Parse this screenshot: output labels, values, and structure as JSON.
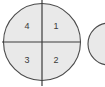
{
  "canvas": {
    "width": 105,
    "height": 87,
    "background_color": "#ffffff"
  },
  "style": {
    "circle_fill": "#e9e9e9",
    "circle_stroke": "#4a4a4a",
    "circle_stroke_width": 1.1,
    "axis_stroke": "#3c3c3c",
    "axis_stroke_width": 1.2,
    "label_color": "#3a3a3a",
    "label_font_size": 9
  },
  "main_circle": {
    "name": "quadrant-circle",
    "center_x": 42,
    "center_y": 42,
    "radius": 38.5,
    "quadrants": [
      {
        "id": "q-upper-right",
        "label": "1",
        "position": "upper-right",
        "label_x": 56,
        "label_y": 26
      },
      {
        "id": "q-lower-right",
        "label": "2",
        "position": "lower-right",
        "label_x": 56,
        "label_y": 60
      },
      {
        "id": "q-lower-left",
        "label": "3",
        "position": "lower-left",
        "label_x": 27,
        "label_y": 60
      },
      {
        "id": "q-upper-left",
        "label": "4",
        "position": "upper-left",
        "label_x": 27,
        "label_y": 26
      }
    ]
  },
  "axes": {
    "vertical": {
      "name": "vertical-divider",
      "x": 42,
      "y1": 0,
      "y2": 86
    },
    "horizontal": {
      "name": "horizontal-divider",
      "y": 42,
      "x1": 2,
      "x2": 80
    }
  },
  "secondary_circle": {
    "name": "secondary-circle-clipped",
    "center_x": 109,
    "center_y": 44,
    "radius": 21,
    "clipped": true,
    "note": "Only the left arc is visible at the right edge of the frame."
  }
}
